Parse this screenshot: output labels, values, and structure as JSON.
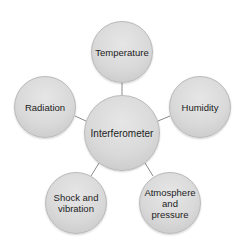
{
  "diagram": {
    "type": "hub-and-spoke",
    "center": {
      "label": "Interferometer",
      "cx": 122,
      "cy": 133,
      "r": 38
    },
    "nodes": [
      {
        "id": "temperature",
        "label": "Temperature",
        "cx": 122,
        "cy": 52,
        "r": 31
      },
      {
        "id": "humidity",
        "label": "Humidity",
        "cx": 200,
        "cy": 107,
        "r": 31
      },
      {
        "id": "atmosphere",
        "label": "Atmosphere\nand\npressure",
        "cx": 170,
        "cy": 203,
        "r": 31
      },
      {
        "id": "shock",
        "label": "Shock and\nvibration",
        "cx": 76,
        "cy": 203,
        "r": 31
      },
      {
        "id": "radiation",
        "label": "Radiation",
        "cx": 45,
        "cy": 107,
        "r": 31
      }
    ],
    "colors": {
      "node_fill_light": "#e6e6e6",
      "node_fill_dark": "#c4c4c4",
      "node_border": "#b9b9b9",
      "connector": "#8a8a8a",
      "text": "#1c1c1c",
      "background": "#ffffff"
    }
  }
}
